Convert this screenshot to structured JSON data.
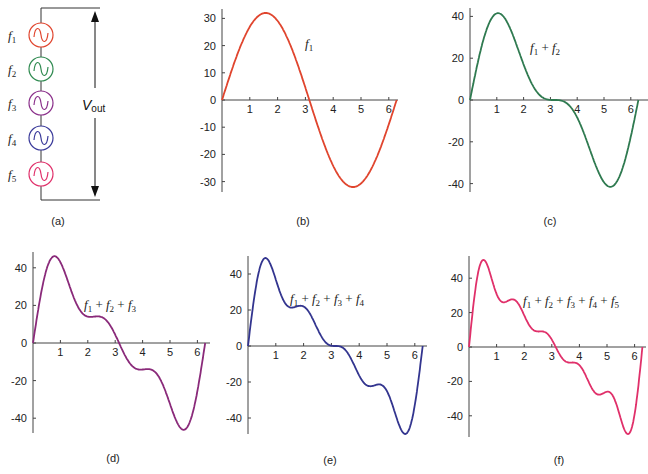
{
  "circuit": {
    "caption": "(a)",
    "sources": [
      {
        "label": "f",
        "sub": "1",
        "color": "#e0452e"
      },
      {
        "label": "f",
        "sub": "2",
        "color": "#2f8a50"
      },
      {
        "label": "f",
        "sub": "3",
        "color": "#8a2f8a"
      },
      {
        "label": "f",
        "sub": "4",
        "color": "#3a3a9a"
      },
      {
        "label": "f",
        "sub": "5",
        "color": "#e0306a"
      }
    ],
    "vout_label": "V",
    "vout_sub": "out"
  },
  "chart_data": [
    {
      "id": "b",
      "type": "line",
      "caption": "(b)",
      "annotation": "f1",
      "color": "#e0452e",
      "harmonics": 1,
      "amplitude": 32,
      "xticks": [
        1,
        2,
        3,
        4,
        5,
        6
      ],
      "yticks": [
        30,
        20,
        10,
        0,
        -10,
        -20,
        -30
      ],
      "xlim": [
        0,
        6.28
      ],
      "ylim": [
        -33,
        33
      ],
      "title": "",
      "xlabel": "",
      "ylabel": ""
    },
    {
      "id": "c",
      "type": "line",
      "caption": "(c)",
      "annotation": "f1 + f2",
      "color": "#2f7a50",
      "harmonics": 2,
      "amplitude": 32,
      "xticks": [
        1,
        2,
        3,
        4,
        5,
        6
      ],
      "yticks": [
        40,
        20,
        0,
        -20,
        -40
      ],
      "xlim": [
        0,
        6.28
      ],
      "ylim": [
        -43,
        43
      ]
    },
    {
      "id": "d",
      "type": "line",
      "caption": "(d)",
      "annotation": "f1 + f2 + f3",
      "color": "#8a2a7a",
      "harmonics": 3,
      "amplitude": 32,
      "xticks": [
        1,
        2,
        3,
        4,
        5,
        6
      ],
      "yticks": [
        40,
        20,
        0,
        -20,
        -40
      ],
      "xlim": [
        0,
        6.28
      ],
      "ylim": [
        -48,
        48
      ]
    },
    {
      "id": "e",
      "type": "line",
      "caption": "(e)",
      "annotation": "f1 + f2 + f3 + f4",
      "color": "#33358f",
      "harmonics": 4,
      "amplitude": 32,
      "xticks": [
        1,
        2,
        3,
        4,
        5,
        6
      ],
      "yticks": [
        40,
        20,
        0,
        -20,
        -40
      ],
      "xlim": [
        0,
        6.28
      ],
      "ylim": [
        -50,
        50
      ]
    },
    {
      "id": "f",
      "type": "line",
      "caption": "(f)",
      "annotation": "f1 + f2 + f3 + f4 + f5",
      "color": "#e0306a",
      "harmonics": 5,
      "amplitude": 32,
      "xticks": [
        1,
        2,
        3,
        4,
        5,
        6
      ],
      "yticks": [
        40,
        20,
        0,
        -20,
        -40
      ],
      "xlim": [
        0,
        6.28
      ],
      "ylim": [
        -52,
        52
      ]
    }
  ]
}
